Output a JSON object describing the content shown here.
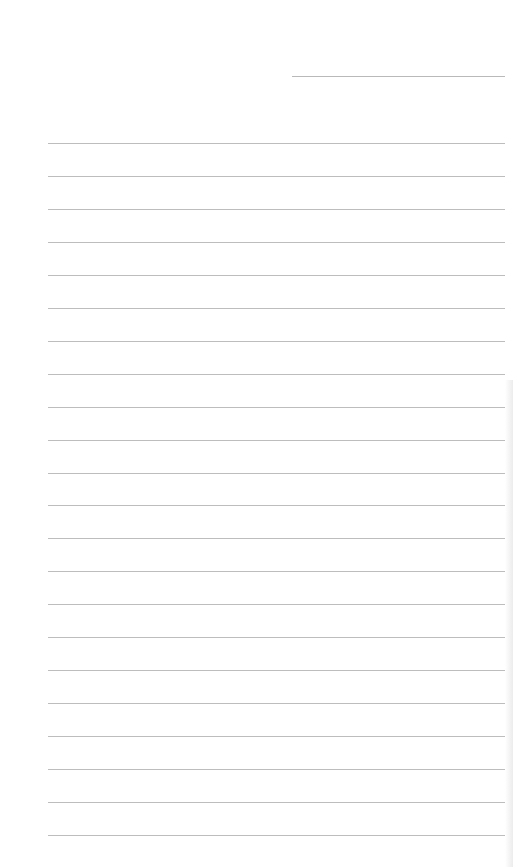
{
  "document": {
    "type": "lined-paper",
    "date_line": {
      "label": ""
    },
    "ruled_lines": {
      "count": 22,
      "first_y": 143,
      "spacing": 32.95,
      "values": [
        "",
        "",
        "",
        "",
        "",
        "",
        "",
        "",
        "",
        "",
        "",
        "",
        "",
        "",
        "",
        "",
        "",
        "",
        "",
        "",
        "",
        ""
      ]
    },
    "colors": {
      "paper": "#ffffff",
      "rule": "#bdbdbd"
    }
  }
}
